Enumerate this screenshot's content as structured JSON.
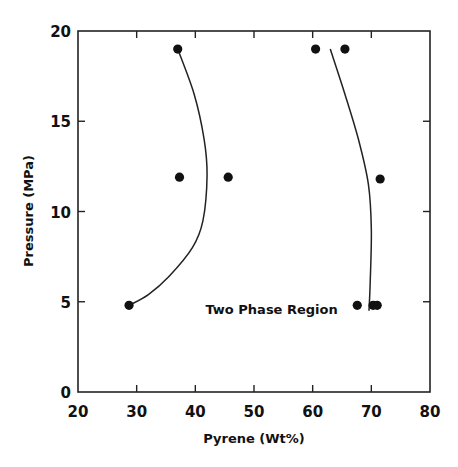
{
  "chart_data": {
    "type": "scatter",
    "title": "",
    "xlabel": "Pyrene (Wt%)",
    "ylabel": "Pressure (MPa)",
    "xlim": [
      20,
      80
    ],
    "ylim": [
      0,
      20
    ],
    "xticks": [
      20,
      30,
      40,
      50,
      60,
      70,
      80
    ],
    "yticks": [
      0,
      5,
      10,
      15,
      20
    ],
    "grid": false,
    "legend": null,
    "annotations": [
      {
        "text": "Two Phase Region",
        "x": 53,
        "y": 4.6
      }
    ],
    "series": [
      {
        "name": "measured points",
        "marker": "filled-circle",
        "points": [
          {
            "x": 37.0,
            "y": 19.0
          },
          {
            "x": 60.5,
            "y": 19.0
          },
          {
            "x": 65.5,
            "y": 19.0
          },
          {
            "x": 37.3,
            "y": 11.9
          },
          {
            "x": 45.6,
            "y": 11.9
          },
          {
            "x": 71.5,
            "y": 11.8
          },
          {
            "x": 28.7,
            "y": 4.8
          },
          {
            "x": 67.6,
            "y": 4.8
          },
          {
            "x": 70.3,
            "y": 4.8
          },
          {
            "x": 71.0,
            "y": 4.8
          }
        ]
      },
      {
        "name": "left phase boundary",
        "type": "line",
        "points": [
          {
            "x": 37.0,
            "y": 19.0
          },
          {
            "x": 39.8,
            "y": 16.5
          },
          {
            "x": 41.5,
            "y": 14.0
          },
          {
            "x": 42.0,
            "y": 12.0
          },
          {
            "x": 41.3,
            "y": 9.5
          },
          {
            "x": 39.5,
            "y": 8.0
          },
          {
            "x": 35.5,
            "y": 6.4
          },
          {
            "x": 32.0,
            "y": 5.4
          },
          {
            "x": 28.7,
            "y": 4.8
          }
        ]
      },
      {
        "name": "right phase boundary",
        "type": "line",
        "points": [
          {
            "x": 63.0,
            "y": 19.0
          },
          {
            "x": 65.5,
            "y": 16.5
          },
          {
            "x": 67.8,
            "y": 14.0
          },
          {
            "x": 69.5,
            "y": 11.5
          },
          {
            "x": 70.0,
            "y": 9.0
          },
          {
            "x": 69.8,
            "y": 6.0
          },
          {
            "x": 69.6,
            "y": 4.5
          }
        ]
      }
    ]
  }
}
